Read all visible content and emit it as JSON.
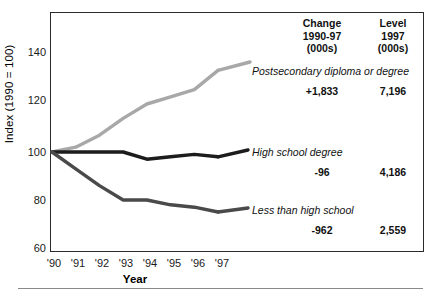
{
  "chart_data": {
    "type": "line",
    "title": "",
    "xlabel": "Year",
    "ylabel": "Index (1990 = 100)",
    "x": [
      "'90",
      "'91",
      "'92",
      "'93",
      "'94",
      "'95",
      "'96",
      "'97"
    ],
    "xlim": [
      "'90",
      "'97"
    ],
    "ylim": [
      60,
      140
    ],
    "yticks": [
      140,
      120,
      100,
      80,
      60
    ],
    "grid": false,
    "legend_position": "right-inline",
    "series": [
      {
        "name": "Postsecondary diploma or degree",
        "color": "#a8a8a8",
        "values": [
          100,
          102,
          107,
          114,
          120,
          123,
          126,
          134
        ],
        "change_1990_97": "+1,833",
        "level_1997": "7,196"
      },
      {
        "name": "High school degree",
        "color": "#1c1c1c",
        "values": [
          100,
          100,
          100,
          100,
          97,
          98,
          99,
          98
        ],
        "change_1990_97": "-96",
        "level_1997": "4,186"
      },
      {
        "name": "Less than high school",
        "color": "#4a4a4a",
        "values": [
          100,
          93,
          86,
          80,
          80,
          78,
          77,
          75
        ],
        "change_1990_97": "-962",
        "level_1997": "2,559"
      }
    ],
    "columns": [
      {
        "header_line1": "Change",
        "header_line2": "1990-97",
        "header_line3": "(000s)"
      },
      {
        "header_line1": "Level",
        "header_line2": "1997",
        "header_line3": "(000s)"
      }
    ]
  }
}
